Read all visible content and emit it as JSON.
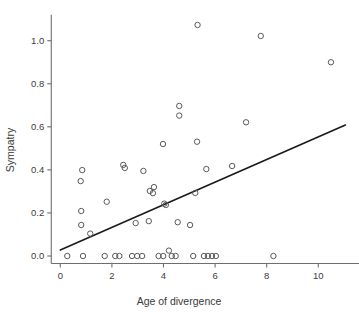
{
  "chart_data": {
    "type": "scatter",
    "title": "",
    "xlabel": "Age of divergence",
    "ylabel": "Sympatry",
    "xlim": [
      -0.35,
      11.6
    ],
    "ylim": [
      -0.035,
      1.12
    ],
    "xticks": [
      0,
      2,
      4,
      6,
      8,
      10
    ],
    "xticklabels": [
      "0",
      "2",
      "4",
      "6",
      "8",
      "10"
    ],
    "yticks": [
      0.0,
      0.2,
      0.4,
      0.6,
      0.8,
      1.0
    ],
    "yticklabels": [
      "0.0",
      "0.2",
      "0.4",
      "0.6",
      "0.8",
      "1.0"
    ],
    "grid": false,
    "legend": "none",
    "marker": "open-circle",
    "marker_color": "#5a5a5a",
    "line_color": "#1a1a1a",
    "points": [
      {
        "x": 5.32,
        "y": 1.073
      },
      {
        "x": 7.77,
        "y": 1.022
      },
      {
        "x": 10.49,
        "y": 0.9
      },
      {
        "x": 4.61,
        "y": 0.697
      },
      {
        "x": 4.61,
        "y": 0.652
      },
      {
        "x": 7.2,
        "y": 0.621
      },
      {
        "x": 5.3,
        "y": 0.531
      },
      {
        "x": 3.98,
        "y": 0.52
      },
      {
        "x": 2.44,
        "y": 0.423
      },
      {
        "x": 2.5,
        "y": 0.409
      },
      {
        "x": 0.85,
        "y": 0.399
      },
      {
        "x": 5.66,
        "y": 0.404
      },
      {
        "x": 6.66,
        "y": 0.418
      },
      {
        "x": 3.22,
        "y": 0.395
      },
      {
        "x": 0.79,
        "y": 0.348
      },
      {
        "x": 3.63,
        "y": 0.32
      },
      {
        "x": 3.47,
        "y": 0.302
      },
      {
        "x": 3.59,
        "y": 0.292
      },
      {
        "x": 5.23,
        "y": 0.293
      },
      {
        "x": 1.8,
        "y": 0.252
      },
      {
        "x": 4.03,
        "y": 0.243
      },
      {
        "x": 4.09,
        "y": 0.237
      },
      {
        "x": 0.81,
        "y": 0.209
      },
      {
        "x": 0.81,
        "y": 0.144
      },
      {
        "x": 3.43,
        "y": 0.162
      },
      {
        "x": 2.92,
        "y": 0.153
      },
      {
        "x": 4.55,
        "y": 0.157
      },
      {
        "x": 5.03,
        "y": 0.144
      },
      {
        "x": 1.16,
        "y": 0.104
      },
      {
        "x": 4.21,
        "y": 0.025
      },
      {
        "x": 0.27,
        "y": 0.0
      },
      {
        "x": 0.88,
        "y": 0.0
      },
      {
        "x": 1.72,
        "y": 0.0
      },
      {
        "x": 2.13,
        "y": 0.0
      },
      {
        "x": 2.29,
        "y": 0.0
      },
      {
        "x": 2.78,
        "y": 0.0
      },
      {
        "x": 2.98,
        "y": 0.0
      },
      {
        "x": 3.17,
        "y": 0.0
      },
      {
        "x": 3.81,
        "y": 0.0
      },
      {
        "x": 3.99,
        "y": 0.0
      },
      {
        "x": 4.32,
        "y": 0.0
      },
      {
        "x": 4.47,
        "y": 0.0
      },
      {
        "x": 5.15,
        "y": 0.0
      },
      {
        "x": 5.57,
        "y": 0.0
      },
      {
        "x": 5.72,
        "y": 0.0
      },
      {
        "x": 5.88,
        "y": 0.0
      },
      {
        "x": 6.03,
        "y": 0.0
      },
      {
        "x": 8.26,
        "y": 0.0
      }
    ],
    "fit_line": {
      "x0": 0.0,
      "y0": 0.028,
      "x1": 11.05,
      "y1": 0.608
    }
  }
}
